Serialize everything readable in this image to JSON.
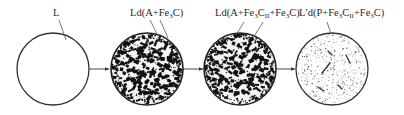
{
  "diagram": {
    "type": "microstructure-transformation-sequence",
    "stages": [
      {
        "id": "liquid",
        "label": {
          "main": "L",
          "parts": []
        },
        "circle": {
          "cx": 53,
          "cy": 69,
          "r": 36
        },
        "texture": "empty",
        "leaders": [
          [
            56,
            18,
            65,
            40
          ]
        ]
      },
      {
        "id": "ledeburite",
        "label": {
          "main": "Ld(A+Fe",
          "sub1": "3",
          "mid": "C)",
          "sub2": "",
          "tail": ""
        },
        "circle": {
          "cx": 147,
          "cy": 69,
          "r": 36
        },
        "texture": "dense-dendritic",
        "leaders": [
          [
            153,
            20,
            160,
            36
          ],
          [
            163,
            20,
            169,
            38
          ]
        ]
      },
      {
        "id": "ledeburite-secondary-cementite",
        "label": {
          "main": "Ld(A+Fe",
          "sub1": "3",
          "mid": "C",
          "sub2": "II",
          "tail": "+Fe₃C)"
        },
        "circle": {
          "cx": 240,
          "cy": 69,
          "r": 36
        },
        "texture": "dense-dendritic",
        "leaders": [
          [
            243,
            21,
            236,
            34
          ],
          [
            262,
            21,
            252,
            36
          ]
        ]
      },
      {
        "id": "transformed-ledeburite",
        "label": {
          "main": "L′d(P+Fe",
          "sub1": "3",
          "mid": "C",
          "sub2": "II",
          "tail": "+Fe₃C)"
        },
        "circle": {
          "cx": 332,
          "cy": 69,
          "r": 36
        },
        "texture": "sparse-speckle",
        "leaders": [
          [
            327,
            21,
            331,
            34
          ]
        ]
      }
    ],
    "arrows": [
      {
        "from": "liquid",
        "to": "ledeburite",
        "x1": 89,
        "x2": 110,
        "y": 69
      },
      {
        "from": "ledeburite",
        "to": "ledeburite-secondary-cementite",
        "x1": 183,
        "x2": 203,
        "y": 69
      },
      {
        "from": "ledeburite-secondary-cementite",
        "to": "transformed-ledeburite",
        "x1": 276,
        "x2": 296,
        "y": 69
      }
    ],
    "colors": {
      "stroke": "#333333",
      "fill": "#ffffff",
      "ink": "#1a1a1a",
      "speckle": "#555555"
    }
  },
  "labels": {
    "l": "L",
    "ld1_main": "Ld(A+Fe",
    "ld1_sub": "3",
    "ld1_tail": "C)",
    "ld2_main": "Ld(A+Fe",
    "ld2_sub": "3",
    "ld2_c": "C",
    "ld2_subII": "II",
    "ld2_tail1": "+Fe",
    "ld2_sub3": "3",
    "ld2_tail2": "C)",
    "ldp_main": "L′d(P+Fe",
    "ldp_sub": "3",
    "ldp_c": "C",
    "ldp_subII": "II",
    "ldp_tail1": "+Fe",
    "ldp_sub3": "3",
    "ldp_tail2": "C)"
  }
}
